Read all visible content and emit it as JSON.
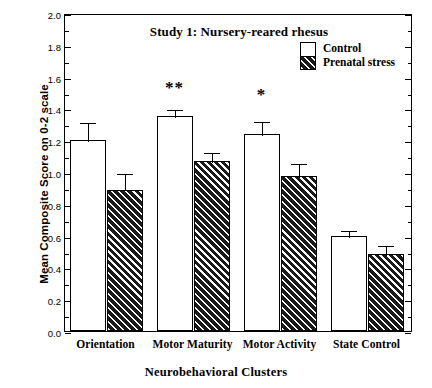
{
  "chart_data": {
    "type": "bar",
    "title": "Study 1: Nursery-reared rhesus",
    "xlabel": "Neurobehavioral Clusters",
    "ylabel": "Mean Composite Score on 0-2 scale",
    "ylim": [
      0.0,
      2.0
    ],
    "ytick_step": 0.2,
    "yminor_step": 0.1,
    "grid": false,
    "legend_position": "top-right",
    "categories": [
      "Orientation",
      "Motor Maturity",
      "Motor Activity",
      "State Control"
    ],
    "ytick_labels": [
      "0.0",
      "0.2",
      "0.4",
      "0.6",
      "0.8",
      "1.0",
      "1.2",
      "1.4",
      "1.6",
      "1.8",
      "2.0"
    ],
    "ytick_values": [
      0.0,
      0.2,
      0.4,
      0.6,
      0.8,
      1.0,
      1.2,
      1.4,
      1.6,
      1.8,
      2.0
    ],
    "series": [
      {
        "name": "Control",
        "fill": "white",
        "values": [
          1.2,
          1.35,
          1.24,
          0.6
        ],
        "errors": [
          0.12,
          0.05,
          0.09,
          0.04
        ]
      },
      {
        "name": "Prenatal stress",
        "fill": "hatched",
        "values": [
          0.89,
          1.07,
          0.975,
          0.485
        ],
        "errors": [
          0.11,
          0.06,
          0.085,
          0.065
        ]
      }
    ],
    "annotations": [
      {
        "text": "**",
        "category": "Motor Maturity",
        "y": 1.6
      },
      {
        "text": "*",
        "category": "Motor Activity",
        "y": 1.555
      }
    ],
    "colors": {
      "axis": "#000000",
      "control_fill": "#ffffff",
      "stress_fill": "#1a1a1a",
      "text": "#000000",
      "background": "#ffffff"
    }
  },
  "legend": {
    "items": [
      {
        "label": "Control"
      },
      {
        "label": "Prenatal stress"
      }
    ]
  }
}
